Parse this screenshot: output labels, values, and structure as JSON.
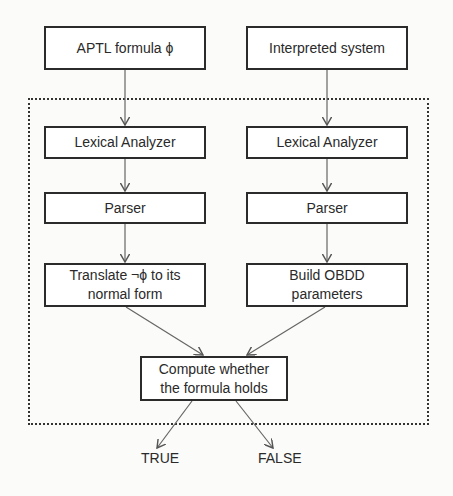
{
  "diagram": {
    "left_column": {
      "input": "APTL formula ϕ",
      "lexer": "Lexical Analyzer",
      "parser": "Parser",
      "transform": "Translate ¬ϕ to its normal form"
    },
    "right_column": {
      "input": "Interpreted system",
      "lexer": "Lexical Analyzer",
      "parser": "Parser",
      "transform": "Build OBDD parameters"
    },
    "compute": "Compute whether the formula holds",
    "outputs": {
      "true_label": "TRUE",
      "false_label": "FALSE"
    },
    "colors": {
      "line": "#555555",
      "border": "#2b2b2b"
    }
  }
}
